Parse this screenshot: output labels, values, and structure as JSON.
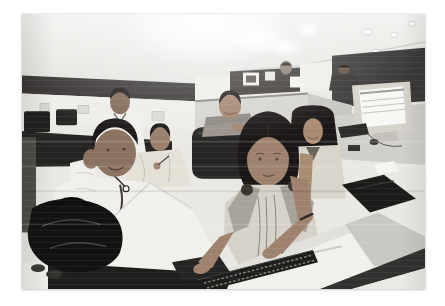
{
  "window": {
    "width": 445,
    "height": 306
  },
  "photo": {
    "kind": "photograph",
    "alt": "Slightly tilted wide-angle photo of a bright open-plan office: seven smiling young workers among white desks and cubicle partitions; a woman in the foreground reaches down to a keyboard, a black bag sits on the desk at left and a CRT monitor glows at right.",
    "setting": "open-plan office / call-centre with cubicle workstations",
    "people_count": 8,
    "people": [
      {
        "id": "standing-man",
        "description": "man in white shirt standing at back left"
      },
      {
        "id": "foreground-man",
        "description": "smiling man in light shirt, hand raised to his ear holding eyeglasses"
      },
      {
        "id": "shawl-woman",
        "description": "seated woman wrapped in a cream shawl holding a pen"
      },
      {
        "id": "chair-woman",
        "description": "woman leaning with folded arms on a dark office chair"
      },
      {
        "id": "right-woman",
        "description": "long-haired woman with light dupatta smiling at camera"
      },
      {
        "id": "main-woman",
        "description": "foreground woman in light kurta with dark-knotted dupatta reaching to the keyboard"
      },
      {
        "id": "far-right-man",
        "description": "man working at a far desk beside the monitor"
      },
      {
        "id": "distant-figure",
        "description": "blurred worker behind a far cubicle panel"
      }
    ],
    "objects": [
      "white curved desks",
      "glossy black bag",
      "computer keyboard",
      "beige CRT monitor",
      "dark office chair",
      "cubicle partitions with dark top bands",
      "pinned papers and framed pictures",
      "ceiling spotlights and light blooms",
      "dark bag on right desk",
      "eyeglasses",
      "pen",
      "wrist bracelet"
    ],
    "palette": {
      "ceiling": "#eeefec",
      "band_dark": "#332f2d",
      "band_dark2": "#3a3431",
      "panel_white": "#efeee8",
      "partition_gray": "#d7d5cf",
      "partition_dark": "#3b3837",
      "desk_white": "#f2f1eb",
      "desk_gray": "#d2d0ca",
      "desk_shaded": "#cbc9c2",
      "shirt_white": "#f2f0e9",
      "shawl_cream": "#e7e1d1",
      "shawl_cream2": "#ddd6c6",
      "shawl_taupe": "#8f867a",
      "kurta_light": "#d9d3c4",
      "dupatta_gray": "#aaa396",
      "skin_man": "#99６e51",
      "skin_man_fix": "#996e51",
      "skin_woman": "#ad7f5e",
      "skin_light": "#b8895f",
      "hair_dark": "#1b1613",
      "chair_dark": "#262524",
      "bag_black": "#121110",
      "keyboard_dark": "#1c1b19",
      "monitor_beige": "#d8d4c7",
      "screen_white": "#f8f8f4",
      "shadow_dark": "#31302e",
      "edge_light": "#eceae2"
    }
  }
}
